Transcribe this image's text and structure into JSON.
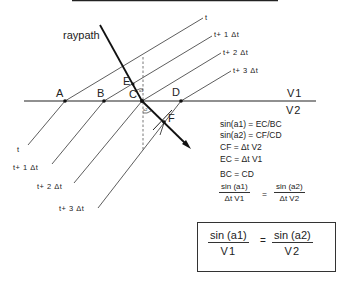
{
  "diagram": {
    "labels": {
      "raypath": "raypath",
      "points": {
        "A": "A",
        "B": "B",
        "C": "C",
        "D": "D",
        "E": "E",
        "F": "F"
      },
      "media": {
        "upper": "V1",
        "lower": "V2"
      },
      "upper_wavefronts": [
        "t",
        "t+ 1 Δt",
        "t+ 2 Δt",
        "t+ 3 Δt"
      ],
      "lower_wavefronts": [
        "t",
        "t+ 1 Δt",
        "t+ 2 Δt",
        "t+ 3 Δt"
      ],
      "angles": {
        "a1": "a1",
        "a2": "a2"
      }
    },
    "equations": [
      "sin(a1) = EC/BC",
      "sin(a2) = CF/CD",
      "CF = Δt  V2",
      "EC = Δt  V1",
      "BC = CD"
    ],
    "ratio_equation": {
      "left_num": "sin  (a1)",
      "left_den": "Δt  V1",
      "equals": "=",
      "right_num": "sin  (a2)",
      "right_den": "Δt  V2"
    },
    "snell_law": {
      "left_num": "sin  (a1)",
      "left_den": "V1",
      "equals": "=",
      "right_num": "sin  (a2)",
      "right_den": "V2"
    },
    "colors": {
      "ink": "#222222",
      "background": "#ffffff"
    }
  }
}
